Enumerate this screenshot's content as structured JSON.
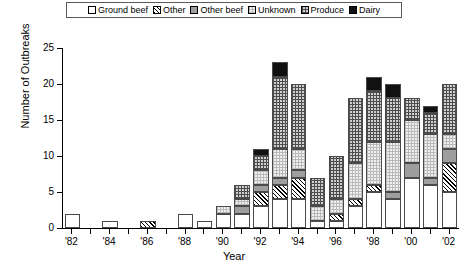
{
  "legend": {
    "position": "top",
    "items": [
      {
        "label": "Ground beef",
        "key": "groundbeef",
        "swatch": "white-open-square",
        "color": "#ffffff"
      },
      {
        "label": "Other",
        "key": "other",
        "swatch": "diagonal-hatch-square",
        "color": "#ffffff"
      },
      {
        "label": "Other beef",
        "key": "otherbeef",
        "swatch": "solid-gray-square",
        "color": "#9e9e9e"
      },
      {
        "label": "Unknown",
        "key": "unknown",
        "swatch": "light-grid-square",
        "color": "#f0f0f0"
      },
      {
        "label": "Produce",
        "key": "produce",
        "swatch": "dark-grid-square",
        "color": "#cfcfcf"
      },
      {
        "label": "Dairy",
        "key": "dairy",
        "swatch": "solid-black-square",
        "color": "#111111"
      }
    ]
  },
  "axes": {
    "ylabel": "Number of Outbreaks",
    "xlabel": "Year",
    "yticks": [
      0,
      5,
      10,
      15,
      20,
      25
    ],
    "ytick_labels": [
      "0",
      "5",
      "10",
      "15",
      "20",
      "25"
    ],
    "ylim": [
      0,
      25
    ],
    "xtick_labels": [
      "'82",
      "'84",
      "'86",
      "'88",
      "'90",
      "'92",
      "'94",
      "'96",
      "'98",
      "'00",
      "'02"
    ]
  },
  "chart_data": {
    "type": "bar",
    "title": "",
    "xlabel": "Year",
    "ylabel": "Number of Outbreaks",
    "ylim": [
      0,
      25
    ],
    "grid": false,
    "stacked": true,
    "legend_position": "top",
    "categories": [
      "'82",
      "'83",
      "'84",
      "'85",
      "'86",
      "'87",
      "'88",
      "'89",
      "'90",
      "'91",
      "'92",
      "'93",
      "'94",
      "'95",
      "'96",
      "'97",
      "'98",
      "'99",
      "'00",
      "'01",
      "'02"
    ],
    "series": [
      {
        "name": "Ground beef",
        "values": [
          2,
          0,
          1,
          0,
          0,
          0,
          2,
          1,
          2,
          2,
          3,
          4,
          4,
          1,
          1,
          3,
          5,
          4,
          7,
          6,
          5
        ]
      },
      {
        "name": "Other",
        "values": [
          0,
          0,
          0,
          0,
          1,
          0,
          0,
          0,
          0,
          0,
          2,
          2,
          3,
          0,
          1,
          1,
          1,
          0,
          0,
          0,
          4
        ]
      },
      {
        "name": "Other beef",
        "values": [
          0,
          0,
          0,
          0,
          0,
          0,
          0,
          0,
          0,
          1,
          1,
          1,
          1,
          0,
          0,
          0,
          0,
          1,
          2,
          1,
          2
        ]
      },
      {
        "name": "Unknown",
        "values": [
          0,
          0,
          0,
          0,
          0,
          0,
          0,
          0,
          1,
          1,
          2,
          4,
          3,
          2,
          2,
          5,
          6,
          7,
          6,
          6,
          2
        ]
      },
      {
        "name": "Produce",
        "values": [
          0,
          0,
          0,
          0,
          0,
          0,
          0,
          0,
          0,
          2,
          2,
          10,
          9,
          4,
          6,
          9,
          7,
          6,
          3,
          3,
          7
        ]
      },
      {
        "name": "Dairy",
        "values": [
          0,
          0,
          0,
          0,
          0,
          0,
          0,
          0,
          0,
          0,
          1,
          2,
          0,
          0,
          0,
          0,
          2,
          2,
          0,
          1,
          0
        ]
      }
    ],
    "totals": [
      2,
      0,
      1,
      0,
      1,
      0,
      2,
      1,
      3,
      6,
      11,
      23,
      20,
      7,
      10,
      18,
      21,
      20,
      18,
      17,
      20
    ]
  }
}
